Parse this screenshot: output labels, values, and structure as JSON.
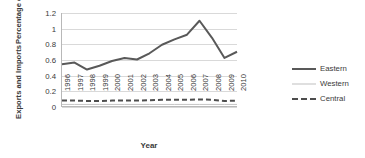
{
  "chart_data": {
    "type": "line",
    "title": "",
    "xlabel": "Year",
    "ylabel": "Exports and Imports Percentage of Regional GDP",
    "ylabel_lines": [
      "Exports and Imports",
      "Percentage of Regional GDP"
    ],
    "x": [
      1996,
      1997,
      1998,
      1999,
      2000,
      2001,
      2002,
      2003,
      2004,
      2005,
      2006,
      2007,
      2008,
      2009,
      2010
    ],
    "categories": [
      "1996",
      "1997",
      "1998",
      "1999",
      "2000",
      "2001",
      "2002",
      "2003",
      "2004",
      "2005",
      "2006",
      "2007",
      "2008",
      "2009",
      "2010"
    ],
    "yticks": [
      "0",
      "0.2",
      "0.4",
      "0.6",
      "0.8",
      "1",
      "1.2"
    ],
    "ytick_values": [
      0,
      0.2,
      0.4,
      0.6,
      0.8,
      1.0,
      1.2
    ],
    "ylim": [
      0,
      1.2
    ],
    "grid": true,
    "legend_position": "right",
    "series": [
      {
        "name": "Eastern",
        "style": "solid-thick",
        "color": "#595959",
        "values": [
          0.54,
          0.56,
          0.47,
          0.52,
          0.58,
          0.62,
          0.6,
          0.68,
          0.79,
          0.86,
          0.92,
          1.1,
          0.88,
          0.62,
          0.7
        ]
      },
      {
        "name": "Western",
        "style": "solid-thin",
        "color": "#bfbfbf",
        "values": [
          0.02,
          0.02,
          0.02,
          0.02,
          0.02,
          0.02,
          0.02,
          0.02,
          0.02,
          0.02,
          0.02,
          0.02,
          0.02,
          0.02,
          0.02
        ]
      },
      {
        "name": "Central",
        "style": "dashed",
        "color": "#4d4d4d",
        "values": [
          0.07,
          0.07,
          0.065,
          0.065,
          0.07,
          0.07,
          0.07,
          0.075,
          0.08,
          0.08,
          0.08,
          0.085,
          0.08,
          0.065,
          0.07
        ]
      }
    ]
  },
  "legend": {
    "items": [
      {
        "label": "Eastern"
      },
      {
        "label": "Western"
      },
      {
        "label": "Central"
      }
    ]
  }
}
